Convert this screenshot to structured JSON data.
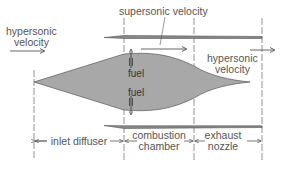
{
  "diagram": {
    "labels": {
      "inlet_velocity": [
        "hypersonic",
        "velocity"
      ],
      "supersonic": "supersonic velocity",
      "exit_velocity": [
        "hypersonic",
        "velocity"
      ],
      "fuel_top": "fuel",
      "fuel_bottom": "fuel"
    },
    "sections": [
      {
        "id": "inlet",
        "lines": [
          "inlet diffuser"
        ]
      },
      {
        "id": "combustion",
        "lines": [
          "combustion",
          "chamber"
        ]
      },
      {
        "id": "exhaust",
        "lines": [
          "exhaust",
          "nozzle"
        ]
      }
    ],
    "colors": {
      "body_fill": "#a8a8a8",
      "line": "#555555",
      "text": "#555555"
    }
  }
}
